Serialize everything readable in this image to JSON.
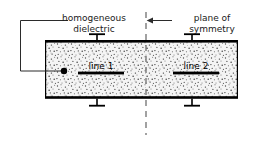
{
  "figure": {
    "annotations": {
      "homogeneous_dielectric": "homogeneous\ndielectric",
      "plane_of_symmetry": "plane of\nsymmetry"
    },
    "conductors": [
      {
        "id": "line1",
        "label": "line 1"
      },
      {
        "id": "line2",
        "label": "line 2"
      }
    ],
    "colors": {
      "stroke": "#000000",
      "text": "#1a1a1a",
      "dielectric_fill": "#f2f2f2",
      "stipple": "#4d4d4d",
      "dashed_line": "#555555",
      "background": "#ffffff"
    },
    "geometry": {
      "slab": {
        "x": 45,
        "y": 41,
        "width": 193,
        "height": 57
      },
      "symmetry_line_x": 146,
      "symmetry_line_top": 12,
      "symmetry_line_bottom": 135,
      "feed_dot": {
        "x": 64,
        "y": 71,
        "r": 3
      },
      "conductor_bars": [
        {
          "x1": 78,
          "x2": 124,
          "y": 73
        },
        {
          "x1": 173,
          "x2": 219,
          "y": 73
        }
      ],
      "ground_stubs_top": [
        97,
        192
      ],
      "ground_stubs_bottom": [
        97,
        192
      ]
    }
  }
}
